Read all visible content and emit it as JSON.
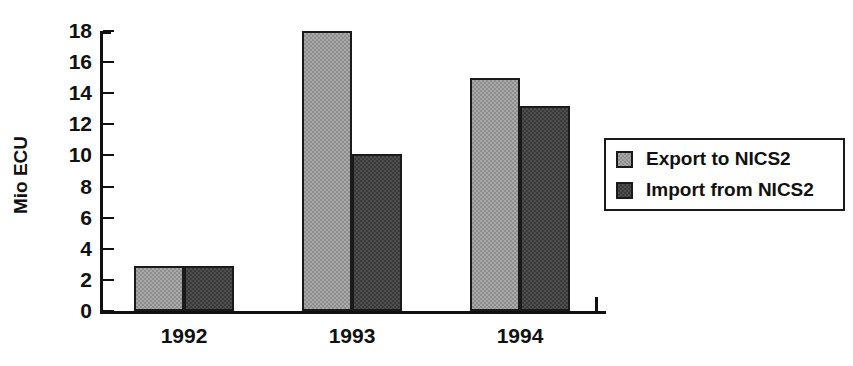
{
  "chart_data": {
    "type": "bar",
    "title": "",
    "subtitle": "",
    "xlabel": "",
    "ylabel": "Mio ECU",
    "categories": [
      "1992",
      "1993",
      "1994"
    ],
    "series": [
      {
        "name": "Export to NICS2",
        "values": [
          2.9,
          18.0,
          15.0
        ],
        "color": "#a8a8a8"
      },
      {
        "name": "Import from NICS2",
        "values": [
          2.9,
          10.1,
          13.2
        ],
        "color": "#4e4e4e"
      }
    ],
    "ylim": [
      0,
      18
    ],
    "yticks": [
      0,
      2,
      4,
      6,
      8,
      10,
      12,
      14,
      16,
      18
    ],
    "ytick_labels": [
      "0",
      "2",
      "4",
      "6",
      "8",
      "10",
      "12",
      "14",
      "16",
      "18"
    ],
    "grid": false,
    "legend_position": "right",
    "legend_entries": [
      "Export to NICS2",
      "Import from NICS2"
    ],
    "annotations": []
  },
  "axis": {
    "y_title": "Mio ECU"
  },
  "legend": {
    "items": [
      {
        "label": "Export to NICS2"
      },
      {
        "label": "Import from NICS2"
      }
    ]
  }
}
